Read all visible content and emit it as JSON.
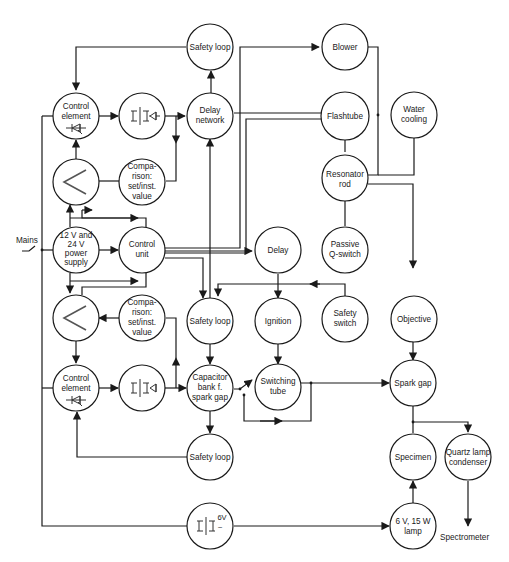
{
  "diagram": {
    "type": "block-diagram",
    "title": "",
    "nodes": {
      "safety_loop_top": {
        "lines": [
          "Safety loop"
        ]
      },
      "blower": {
        "lines": [
          "Blower"
        ]
      },
      "control_element_top": {
        "lines": [
          "Control",
          "element"
        ]
      },
      "transformer_rectifier_top": {
        "lines": [],
        "icon": "transformer-rectifier-icon"
      },
      "delay_network": {
        "lines": [
          "Delay",
          "network"
        ]
      },
      "flashtube": {
        "lines": [
          "Flashtube"
        ]
      },
      "water_cooling": {
        "lines": [
          "Water",
          "cooling"
        ]
      },
      "amplifier_top": {
        "lines": [],
        "icon": "amplifier-icon"
      },
      "comparison_top": {
        "lines": [
          "Compa-",
          "rison:",
          "set/inst.",
          "value"
        ]
      },
      "resonator_rod": {
        "lines": [
          "Resonator",
          "rod"
        ]
      },
      "power_supply": {
        "lines": [
          "12 V and",
          "24 V",
          "power",
          "supply"
        ]
      },
      "control_unit": {
        "lines": [
          "Control",
          "unit"
        ]
      },
      "delay": {
        "lines": [
          "Delay"
        ]
      },
      "passive_q_switch": {
        "lines": [
          "Passive",
          "Q-switch"
        ]
      },
      "amplifier_bottom": {
        "lines": [],
        "icon": "amplifier-icon"
      },
      "comparison_bottom": {
        "lines": [
          "Compa-",
          "rison:",
          "set/inst.",
          "value"
        ]
      },
      "safety_loop_mid": {
        "lines": [
          "Safety loop"
        ]
      },
      "ignition": {
        "lines": [
          "Ignition"
        ]
      },
      "safety_switch": {
        "lines": [
          "Safety",
          "switch"
        ]
      },
      "objective": {
        "lines": [
          "Objective"
        ]
      },
      "control_element_bottom": {
        "lines": [
          "Control",
          "element"
        ]
      },
      "transformer_rectifier_bottom": {
        "lines": [],
        "icon": "transformer-rectifier-icon"
      },
      "capacitor_bank": {
        "lines": [
          "Capacitor",
          "bank f.",
          "spark gap"
        ]
      },
      "switching_tube": {
        "lines": [
          "Switching",
          "tube"
        ]
      },
      "spark_gap": {
        "lines": [
          "Spark gap"
        ]
      },
      "safety_loop_bottom": {
        "lines": [
          "Safety loop"
        ]
      },
      "specimen": {
        "lines": [
          "Specimen"
        ]
      },
      "quartz_lamp_condenser": {
        "lines": [
          "Quartz lamp",
          "condenser"
        ]
      },
      "transformer_6v": {
        "lines": [
          "6V",
          "~"
        ],
        "icon": "transformer-icon"
      },
      "lamp": {
        "lines": [
          "6 V, 15 W",
          "lamp"
        ]
      }
    },
    "external_labels": {
      "mains": "Mains",
      "spectrometer": "Spectrometer"
    },
    "edges": [
      [
        "safety_loop_top",
        "control_element_top"
      ],
      [
        "control_element_top",
        "transformer_rectifier_top"
      ],
      [
        "transformer_rectifier_top",
        "delay_network"
      ],
      [
        "transformer_rectifier_top",
        "comparison_top"
      ],
      [
        "delay_network",
        "safety_loop_top"
      ],
      [
        "delay_network",
        "flashtube"
      ],
      [
        "control_unit",
        "blower"
      ],
      [
        "control_unit",
        "flashtube"
      ],
      [
        "blower",
        "resonator_rod"
      ],
      [
        "flashtube",
        "resonator_rod"
      ],
      [
        "water_cooling",
        "resonator_rod"
      ],
      [
        "resonator_rod",
        "passive_q_switch"
      ],
      [
        "resonator_rod",
        "objective"
      ],
      [
        "amplifier_top",
        "control_element_top"
      ],
      [
        "comparison_top",
        "amplifier_top"
      ],
      [
        "power_supply",
        "amplifier_top"
      ],
      [
        "control_unit",
        "amplifier_top"
      ],
      [
        "power_supply",
        "control_unit"
      ],
      [
        "control_unit",
        "delay_network"
      ],
      [
        "control_unit",
        "delay"
      ],
      [
        "control_unit",
        "safety_loop_mid"
      ],
      [
        "power_supply",
        "amplifier_bottom"
      ],
      [
        "control_unit",
        "amplifier_bottom"
      ],
      [
        "comparison_bottom",
        "amplifier_bottom"
      ],
      [
        "amplifier_bottom",
        "control_element_bottom"
      ],
      [
        "delay",
        "ignition"
      ],
      [
        "safety_switch",
        "safety_loop_mid"
      ],
      [
        "ignition",
        "switching_tube"
      ],
      [
        "control_element_bottom",
        "transformer_rectifier_bottom"
      ],
      [
        "transformer_rectifier_bottom",
        "capacitor_bank"
      ],
      [
        "transformer_rectifier_bottom",
        "comparison_bottom"
      ],
      [
        "safety_loop_mid",
        "capacitor_bank"
      ],
      [
        "capacitor_bank",
        "switching_tube"
      ],
      [
        "capacitor_bank",
        "safety_loop_bottom"
      ],
      [
        "safety_loop_bottom",
        "control_element_bottom"
      ],
      [
        "switching_tube",
        "spark_gap"
      ],
      [
        "objective",
        "spark_gap"
      ],
      [
        "spark_gap",
        "specimen"
      ],
      [
        "spark_gap",
        "quartz_lamp_condenser"
      ],
      [
        "quartz_lamp_condenser",
        "spectrometer"
      ],
      [
        "lamp",
        "specimen"
      ],
      [
        "transformer_6v",
        "lamp"
      ],
      [
        "mains",
        "power_supply"
      ],
      [
        "mains",
        "control_element_top"
      ],
      [
        "mains",
        "control_element_bottom"
      ],
      [
        "mains",
        "transformer_6v"
      ]
    ]
  }
}
